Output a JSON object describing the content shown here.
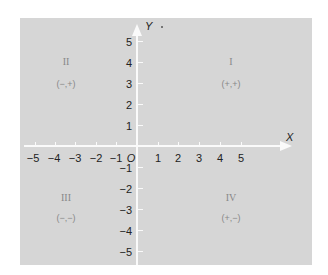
{
  "diagram": {
    "type": "cartesian-plane",
    "axes": {
      "x_label": "X",
      "y_label": "Y",
      "origin_label": "O",
      "x_ticks": [
        "−5",
        "−4",
        "−3",
        "−2",
        "−1",
        "1",
        "2",
        "3",
        "4",
        "5"
      ],
      "y_ticks": [
        "5",
        "4",
        "3",
        "2",
        "1",
        "−1",
        "−2",
        "−3",
        "−4",
        "−5"
      ]
    },
    "quadrants": [
      {
        "numeral": "I",
        "signs": "(+,+)"
      },
      {
        "numeral": "II",
        "signs": "(−,+)"
      },
      {
        "numeral": "III",
        "signs": "(−,−)"
      },
      {
        "numeral": "IV",
        "signs": "(+,−)"
      }
    ],
    "colors": {
      "panel": "#d6d6d6",
      "axes": "#fafafa",
      "labels": "#222222",
      "quadrant_text": "#888888"
    }
  }
}
